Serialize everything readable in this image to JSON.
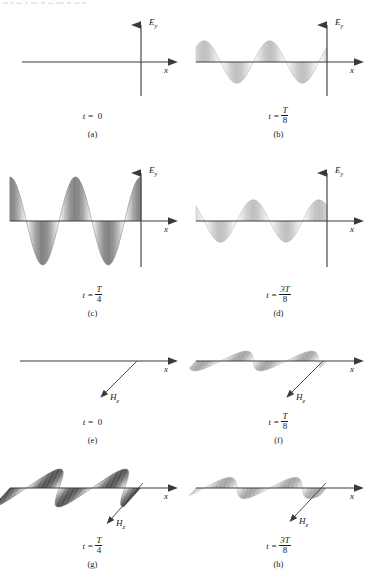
{
  "figure": {
    "title_visible": false,
    "colors": {
      "axis": "#3a3a3a",
      "wave_dark": "#1d1d1d",
      "wave_mid": "#8a8a8a",
      "wave_light": "#cccccc",
      "background": "#ffffff",
      "text": "#1a1a1a"
    }
  },
  "axes": {
    "x_label": "x",
    "e_label": "E",
    "e_subscript": "y",
    "h_label": "H",
    "h_subscript": "z"
  },
  "panels": [
    {
      "id": "a",
      "letter": "(a)",
      "time_prefix": "t =",
      "time_value": "0",
      "time_is_fraction": false,
      "time_numerator": "",
      "time_denominator": "",
      "view": "front",
      "field": "E",
      "amplitude_fraction": 0.0,
      "phase_deg": 0,
      "shade": "none"
    },
    {
      "id": "b",
      "letter": "(b)",
      "time_prefix": "t =",
      "time_value": "T/8",
      "time_is_fraction": true,
      "time_numerator": "T",
      "time_denominator": "8",
      "view": "front",
      "field": "E",
      "amplitude_fraction": 0.707,
      "phase_deg": 45,
      "shade": "light"
    },
    {
      "id": "c",
      "letter": "(c)",
      "time_prefix": "t =",
      "time_value": "T/4",
      "time_is_fraction": true,
      "time_numerator": "T",
      "time_denominator": "4",
      "view": "front",
      "field": "E",
      "amplitude_fraction": 1.0,
      "phase_deg": 90,
      "shade": "dark"
    },
    {
      "id": "d",
      "letter": "(d)",
      "time_prefix": "t =",
      "time_value": "3T/8",
      "time_is_fraction": true,
      "time_numerator": "3T",
      "time_denominator": "8",
      "view": "front",
      "field": "E",
      "amplitude_fraction": 0.707,
      "phase_deg": 135,
      "shade": "light"
    },
    {
      "id": "e",
      "letter": "(e)",
      "time_prefix": "t =",
      "time_value": "0",
      "time_is_fraction": false,
      "time_numerator": "",
      "time_denominator": "",
      "view": "perspective",
      "field": "H",
      "amplitude_fraction": 0.0,
      "phase_deg": 0,
      "shade": "none"
    },
    {
      "id": "f",
      "letter": "(f)",
      "time_prefix": "t =",
      "time_value": "T/8",
      "time_is_fraction": true,
      "time_numerator": "T",
      "time_denominator": "8",
      "view": "perspective",
      "field": "H",
      "amplitude_fraction": 0.707,
      "phase_deg": 45,
      "shade": "light"
    },
    {
      "id": "g",
      "letter": "(g)",
      "time_prefix": "t =",
      "time_value": "T/4",
      "time_is_fraction": true,
      "time_numerator": "T",
      "time_denominator": "4",
      "view": "perspective",
      "field": "H",
      "amplitude_fraction": 1.0,
      "phase_deg": 90,
      "shade": "dark"
    },
    {
      "id": "h",
      "letter": "(h)",
      "time_prefix": "t =",
      "time_value": "3T/8",
      "time_is_fraction": true,
      "time_numerator": "3T",
      "time_denominator": "8",
      "view": "perspective",
      "field": "H",
      "amplitude_fraction": 0.707,
      "phase_deg": 135,
      "shade": "light"
    }
  ]
}
